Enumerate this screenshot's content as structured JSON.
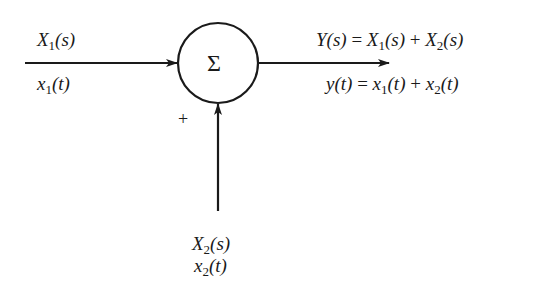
{
  "diagram": {
    "type": "summing-junction",
    "junction": {
      "symbol": "Σ",
      "center": [
        218,
        63
      ],
      "radius": 40
    },
    "input1": {
      "laplace_label": {
        "base": "X",
        "sub": "1",
        "arg": "(s)"
      },
      "time_label": {
        "base": "x",
        "sub": "1",
        "arg": "(t)"
      }
    },
    "input2": {
      "sign": "+",
      "laplace_label": {
        "base": "X",
        "sub": "2",
        "arg": "(s)"
      },
      "time_label": {
        "base": "x",
        "sub": "2",
        "arg": "(t)"
      }
    },
    "output": {
      "laplace_eq": {
        "lhs": "Y(s)",
        "eq": "=",
        "t1_base": "X",
        "t1_sub": "1",
        "t1_arg": "(s)",
        "op": "+",
        "t2_base": "X",
        "t2_sub": "2",
        "t2_arg": "(s)"
      },
      "time_eq": {
        "lhs": "y(t)",
        "eq": "=",
        "t1_base": "x",
        "t1_sub": "1",
        "t1_arg": "(t)",
        "op": "+",
        "t2_base": "x",
        "t2_sub": "2",
        "t2_arg": "(t)"
      }
    },
    "colors": {
      "stroke": "#1a1a1a",
      "background": "#ffffff"
    }
  }
}
